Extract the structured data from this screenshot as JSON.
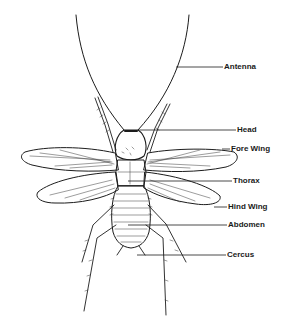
{
  "diagram": {
    "colors": {
      "ink": "#1c1c1c",
      "background": "#ffffff"
    },
    "labels": [
      {
        "id": "antenna",
        "text": "Antenna",
        "x": 224,
        "y": 63,
        "leader_from": [
          176,
          67
        ]
      },
      {
        "id": "head",
        "text": "Head",
        "x": 237,
        "y": 126,
        "leader_from": [
          138,
          130
        ]
      },
      {
        "id": "fore_wing",
        "text": "Fore Wing",
        "x": 231,
        "y": 145,
        "leader_from": [
          222,
          149
        ]
      },
      {
        "id": "thorax",
        "text": "Thorax",
        "x": 233,
        "y": 178,
        "leader_from": [
          128,
          181
        ]
      },
      {
        "id": "hind_wing",
        "text": "Hind Wing",
        "x": 228,
        "y": 203,
        "leader_from": [
          214,
          207
        ]
      },
      {
        "id": "abdomen",
        "text": "Abdomen",
        "x": 228,
        "y": 221,
        "leader_from": [
          128,
          225
        ]
      },
      {
        "id": "cercus",
        "text": "Cercus",
        "x": 227,
        "y": 251,
        "leader_from": [
          137,
          255
        ]
      }
    ]
  }
}
